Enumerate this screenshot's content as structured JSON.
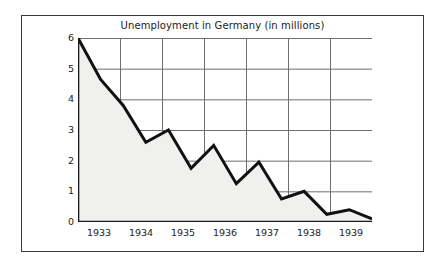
{
  "chart_data": {
    "type": "area",
    "title": "Unemployment in Germany (in millions)",
    "xlabel": "",
    "ylabel": "",
    "ylim": [
      0,
      6
    ],
    "xlim": [
      1932.5,
      1939.5
    ],
    "grid": true,
    "legend": false,
    "legend_position": "none",
    "y_ticks": [
      0,
      1,
      2,
      3,
      4,
      5,
      6
    ],
    "y_tick_labels": [
      "0",
      "1",
      "2",
      "3",
      "4",
      "5",
      "6"
    ],
    "x_ticks": [
      1933,
      1934,
      1935,
      1936,
      1937,
      1938,
      1939
    ],
    "x_tick_labels": [
      "1933",
      "1934",
      "1935",
      "1936",
      "1937",
      "1938",
      "1939"
    ],
    "categories": [
      "1933.0",
      "1933.5",
      "1934.0",
      "1934.5",
      "1935.0",
      "1935.5",
      "1936.0",
      "1936.5",
      "1937.0",
      "1937.5",
      "1938.0",
      "1938.5",
      "1939.0",
      "1939.5"
    ],
    "values": [
      6.0,
      4.65,
      3.8,
      2.6,
      3.0,
      1.75,
      2.5,
      1.25,
      1.95,
      0.75,
      1.0,
      0.25,
      0.4,
      0.1
    ],
    "series": [
      {
        "name": "Unemployment (millions)",
        "values": [
          6.0,
          4.65,
          3.8,
          2.6,
          3.0,
          1.75,
          2.5,
          1.25,
          1.95,
          0.75,
          1.0,
          0.25,
          0.4,
          0.1
        ]
      }
    ],
    "colors": {
      "line": "#111111",
      "fill": "#f0f0ee",
      "grid": "#6e6e6e",
      "axis": "#1a1a1a",
      "frame": "#3a3a3a",
      "background": "#ffffff",
      "text": "#1a1a1a"
    }
  }
}
